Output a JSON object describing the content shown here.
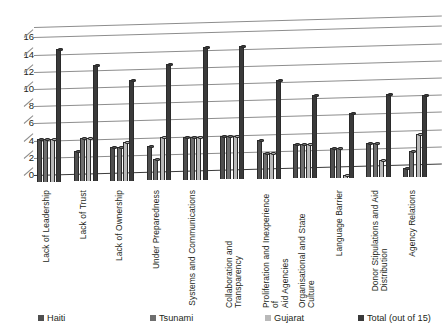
{
  "chart_data": {
    "type": "bar",
    "title": "",
    "subtitle": "",
    "xlabel": "",
    "ylabel": "",
    "ylim": [
      0,
      16
    ],
    "yticks": [
      0,
      2,
      4,
      6,
      8,
      10,
      12,
      14,
      16
    ],
    "grid": true,
    "legend_position": "bottom",
    "orientation": "vertical-3d-clustered",
    "categories": [
      "Lack of Leadership",
      "Lack of Trust",
      "Lack of Ownership",
      "Under Preparedness",
      "Systems and Communications",
      "Collaboration and Transparency",
      "Proliferation and Inexperience of\nAid Agencies",
      "Organisational and State Culture",
      "Language Barrier",
      "Donor Stipulations and Aid\nDistribution",
      "Agency Relations"
    ],
    "series": [
      {
        "name": "Haiti",
        "color": "#4f4f4f",
        "values": [
          5,
          3.5,
          4,
          4,
          5,
          5,
          4.5,
          4,
          3.5,
          4,
          1
        ]
      },
      {
        "name": "Tsunami",
        "color": "#6e6e6e",
        "values": [
          5,
          5,
          4,
          2.5,
          5,
          5,
          3,
          4,
          3.5,
          4,
          3
        ]
      },
      {
        "name": "Gujarat",
        "color": "#b9b9b9",
        "values": [
          5,
          5,
          4.5,
          5,
          5,
          5,
          3,
          4,
          0.3,
          2,
          5
        ]
      },
      {
        "name": "Total (out of 15)",
        "color": "#3a3a3a",
        "values": [
          15.5,
          13.5,
          11.7,
          13.5,
          15.5,
          15.5,
          11.5,
          9.7,
          7.5,
          9.7,
          9.5
        ]
      }
    ]
  },
  "legend": {
    "items": [
      {
        "label": "Haiti",
        "color": "#4f4f4f"
      },
      {
        "label": "Tsunami",
        "color": "#6e6e6e"
      },
      {
        "label": "Gujarat",
        "color": "#b9b9b9"
      },
      {
        "label": "Total (out of 15)",
        "color": "#3a3a3a"
      }
    ]
  }
}
